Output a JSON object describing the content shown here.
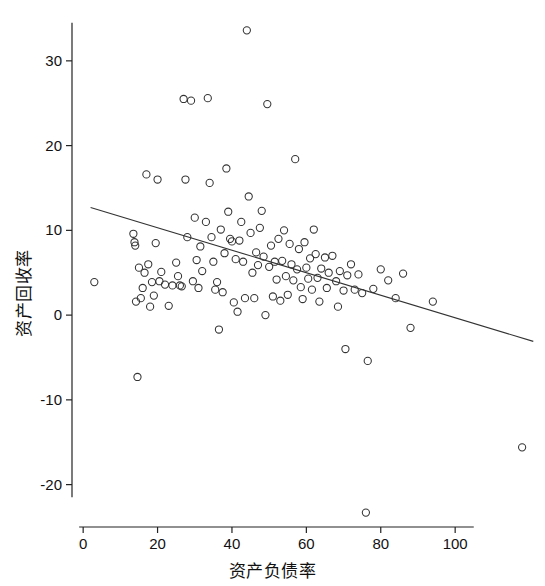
{
  "chart_data": {
    "type": "scatter",
    "title": "",
    "xlabel": "资产负债率",
    "ylabel": "资产回收率",
    "xlim": [
      -3,
      122
    ],
    "ylim": [
      -25,
      36
    ],
    "xticks": [
      0,
      20,
      40,
      60,
      80,
      100
    ],
    "yticks": [
      -20,
      -10,
      0,
      10,
      20,
      30
    ],
    "grid": false,
    "legend": null,
    "marker": "open-circle",
    "marker_color": "#333333",
    "line_color": "#333333",
    "trendline": {
      "type": "linear",
      "x": [
        2.0,
        121.0
      ],
      "y": [
        12.7,
        -3.1
      ]
    },
    "points": [
      [
        3.0,
        3.9
      ],
      [
        13.5,
        9.6
      ],
      [
        13.8,
        8.6
      ],
      [
        14.0,
        8.2
      ],
      [
        14.2,
        1.6
      ],
      [
        14.6,
        -7.3
      ],
      [
        15.0,
        5.6
      ],
      [
        15.5,
        2.0
      ],
      [
        16.0,
        3.2
      ],
      [
        16.5,
        5.0
      ],
      [
        17.0,
        16.6
      ],
      [
        17.5,
        6.0
      ],
      [
        18.0,
        1.0
      ],
      [
        18.5,
        3.9
      ],
      [
        19.0,
        2.3
      ],
      [
        19.5,
        8.5
      ],
      [
        20.0,
        16.0
      ],
      [
        20.5,
        4.0
      ],
      [
        21.0,
        5.1
      ],
      [
        22.0,
        3.6
      ],
      [
        23.0,
        1.1
      ],
      [
        24.0,
        3.5
      ],
      [
        25.0,
        6.2
      ],
      [
        25.5,
        4.6
      ],
      [
        26.0,
        3.5
      ],
      [
        26.5,
        3.4
      ],
      [
        27.0,
        25.5
      ],
      [
        27.5,
        16.0
      ],
      [
        28.0,
        9.2
      ],
      [
        29.0,
        25.3
      ],
      [
        29.5,
        4.0
      ],
      [
        30.0,
        11.5
      ],
      [
        30.5,
        6.5
      ],
      [
        31.0,
        3.2
      ],
      [
        31.5,
        8.1
      ],
      [
        32.0,
        5.2
      ],
      [
        33.0,
        11.0
      ],
      [
        33.5,
        25.6
      ],
      [
        34.0,
        15.6
      ],
      [
        34.5,
        9.2
      ],
      [
        35.0,
        6.3
      ],
      [
        35.5,
        3.0
      ],
      [
        36.0,
        3.9
      ],
      [
        36.5,
        -1.7
      ],
      [
        37.0,
        10.1
      ],
      [
        37.5,
        2.7
      ],
      [
        38.0,
        7.3
      ],
      [
        38.5,
        17.3
      ],
      [
        39.0,
        12.2
      ],
      [
        39.5,
        9.0
      ],
      [
        40.0,
        8.7
      ],
      [
        40.5,
        1.5
      ],
      [
        41.0,
        6.6
      ],
      [
        41.5,
        0.4
      ],
      [
        42.0,
        8.8
      ],
      [
        42.5,
        11.0
      ],
      [
        43.0,
        6.3
      ],
      [
        43.5,
        2.0
      ],
      [
        44.0,
        33.6
      ],
      [
        44.5,
        14.0
      ],
      [
        45.0,
        9.7
      ],
      [
        45.5,
        5.0
      ],
      [
        46.0,
        2.0
      ],
      [
        46.5,
        7.4
      ],
      [
        47.0,
        5.9
      ],
      [
        47.5,
        10.3
      ],
      [
        48.0,
        12.3
      ],
      [
        48.5,
        6.9
      ],
      [
        49.0,
        0.0
      ],
      [
        49.5,
        24.9
      ],
      [
        50.0,
        5.7
      ],
      [
        50.5,
        8.2
      ],
      [
        51.0,
        2.2
      ],
      [
        51.5,
        6.3
      ],
      [
        52.0,
        4.2
      ],
      [
        52.5,
        9.0
      ],
      [
        53.0,
        1.7
      ],
      [
        53.5,
        6.4
      ],
      [
        54.0,
        10.0
      ],
      [
        54.5,
        4.6
      ],
      [
        55.0,
        2.4
      ],
      [
        55.5,
        8.4
      ],
      [
        56.0,
        6.0
      ],
      [
        56.5,
        4.1
      ],
      [
        57.0,
        18.4
      ],
      [
        57.5,
        5.4
      ],
      [
        58.0,
        7.8
      ],
      [
        58.5,
        3.3
      ],
      [
        59.0,
        1.9
      ],
      [
        59.5,
        8.6
      ],
      [
        60.0,
        5.6
      ],
      [
        60.5,
        4.3
      ],
      [
        61.0,
        6.7
      ],
      [
        61.5,
        3.0
      ],
      [
        62.0,
        10.1
      ],
      [
        62.5,
        7.2
      ],
      [
        63.0,
        4.4
      ],
      [
        63.5,
        1.6
      ],
      [
        64.0,
        5.5
      ],
      [
        65.0,
        6.8
      ],
      [
        65.5,
        3.2
      ],
      [
        66.0,
        5.0
      ],
      [
        67.0,
        7.0
      ],
      [
        68.0,
        4.0
      ],
      [
        68.5,
        1.0
      ],
      [
        69.0,
        5.2
      ],
      [
        70.0,
        2.9
      ],
      [
        70.5,
        -4.0
      ],
      [
        71.0,
        4.7
      ],
      [
        72.0,
        6.0
      ],
      [
        73.0,
        3.0
      ],
      [
        74.0,
        4.8
      ],
      [
        75.0,
        2.6
      ],
      [
        76.0,
        -23.3
      ],
      [
        76.5,
        -5.4
      ],
      [
        78.0,
        3.1
      ],
      [
        80.0,
        5.4
      ],
      [
        82.0,
        4.1
      ],
      [
        84.0,
        2.0
      ],
      [
        86.0,
        4.9
      ],
      [
        88.0,
        -1.5
      ],
      [
        94.0,
        1.6
      ],
      [
        118.0,
        -15.6
      ]
    ]
  }
}
